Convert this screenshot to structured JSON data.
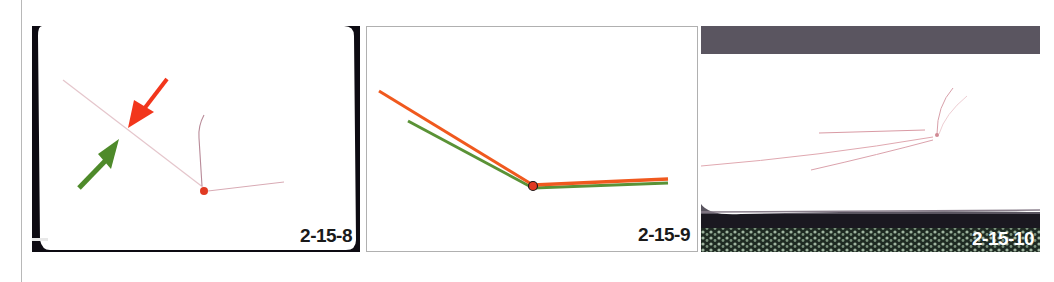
{
  "figure": {
    "panels": [
      {
        "id": "2-15-8",
        "label": "2-15-8",
        "description": "Photo of white surface with faint scratch lines; red arrow and green arrow pointing to intersection; red dot at junction"
      },
      {
        "id": "2-15-9",
        "label": "2-15-9",
        "description": "Diagram of two overlaid bent lines (orange and green) meeting at a red dot"
      },
      {
        "id": "2-15-10",
        "label": "2-15-10",
        "description": "Photo of white surface with faint fanning red scratch lines converging to a point"
      }
    ],
    "colors": {
      "red_arrow": "#f2361c",
      "green_arrow": "#4e8a2a",
      "orange_line": "#f0591e",
      "green_line": "#5a9236",
      "dot": "#e03a22",
      "scratch": "#d9a0a8",
      "frame_dark": "#0d0b12"
    }
  }
}
